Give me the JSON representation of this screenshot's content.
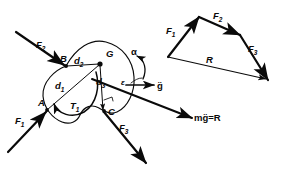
{
  "figure": {
    "stroke_color": "#0a0a0a",
    "background": "#ffffff"
  },
  "body_diagram": {
    "name": "rigid-body-free-body-diagram",
    "points": [
      {
        "id": "A",
        "label": "A",
        "x": 47,
        "y": 110
      },
      {
        "id": "B",
        "label": "B",
        "x": 66,
        "y": 66
      },
      {
        "id": "C",
        "label": "C",
        "x": 105,
        "y": 110
      },
      {
        "id": "G",
        "label": "G",
        "x": 101,
        "y": 62
      }
    ],
    "forces": [
      {
        "id": "F1",
        "label": "F",
        "sub": "1",
        "applied_at": "A",
        "label_x": 19,
        "label_y": 121
      },
      {
        "id": "F2",
        "label": "F",
        "sub": "2",
        "applied_at": "B",
        "label_x": 42,
        "label_y": 45
      },
      {
        "id": "F3",
        "label": "F",
        "sub": "3",
        "applied_at": "C",
        "label_x": 121,
        "label_y": 128
      }
    ],
    "distances": [
      {
        "id": "d1",
        "label": "d",
        "sub": "1",
        "from": "G",
        "to": "A",
        "label_x": 60,
        "label_y": 86
      },
      {
        "id": "d2",
        "label": "d",
        "sub": "2",
        "from": "G",
        "to": "B",
        "label_x": 80,
        "label_y": 62
      },
      {
        "id": "d3",
        "label": "d",
        "sub": "3",
        "from": "G",
        "to": "R-line",
        "label_x": 100,
        "label_y": 82
      }
    ],
    "moment": {
      "id": "T1",
      "label": "T",
      "sub": "1",
      "label_x": 76,
      "label_y": 106,
      "sense": "counterclockwise"
    },
    "angular_acceleration": {
      "id": "alpha",
      "label": "α",
      "label_x": 135,
      "label_y": 54,
      "sense": "counterclockwise"
    },
    "angle": {
      "id": "epsilon",
      "label": "ε",
      "label_x": 124,
      "label_y": 82
    },
    "acceleration_vector": {
      "id": "gddot",
      "label": "g̈",
      "label_x": 159,
      "label_y": 86
    },
    "resultant_line": {
      "id": "mg-equals-R",
      "label": "mg̈=R",
      "label_x": 196,
      "label_y": 117
    }
  },
  "force_polygon": {
    "name": "force-polygon",
    "vertices": [
      {
        "x": 168,
        "y": 57
      },
      {
        "x": 199,
        "y": 17
      },
      {
        "x": 240,
        "y": 35
      },
      {
        "x": 268,
        "y": 80
      }
    ],
    "edges": [
      {
        "id": "F1",
        "label": "F",
        "sub": "1",
        "label_x": 172,
        "label_y": 31
      },
      {
        "id": "F2",
        "label": "F",
        "sub": "2",
        "label_x": 218,
        "label_y": 17
      },
      {
        "id": "F3",
        "label": "F",
        "sub": "3",
        "label_x": 252,
        "label_y": 49
      },
      {
        "id": "R",
        "label": "R",
        "sub": "",
        "label_x": 210,
        "label_y": 60
      }
    ]
  }
}
